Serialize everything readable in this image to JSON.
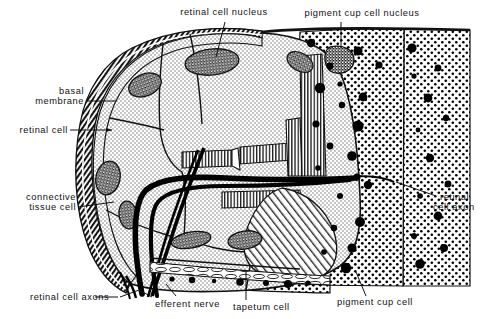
{
  "figure": {
    "colors": {
      "ink": "#111111",
      "background": "#ffffff",
      "cytoplasm_stipple": "#9a9a9a",
      "nucleus_speckle": "#3b3b3b",
      "pigment_granule": "#000000",
      "nerve_fiber": "#000000"
    }
  },
  "labels": {
    "retinal_cell_nucleus": "retinal cell nucleus",
    "pigment_cup_cell_nucleus": "pigment cup cell nucleus",
    "basal_membrane_line1": "basal",
    "basal_membrane_line2": "membrane",
    "retinal_cell": "retinal cell",
    "connective_tissue_cell_line1": "connective",
    "connective_tissue_cell_line2": "tissue cell",
    "retinal_cell_axons": "retinal cell axons",
    "efferent_nerve": "efferent nerve",
    "tapetum_cell": "tapetum cell",
    "pigment_cup_cell": "pigment cup cell",
    "retinal_cell_axon_line1": "retinal",
    "retinal_cell_axon_line2": "cell axon"
  },
  "structures": [
    {
      "name": "retinal-cell",
      "count": 6,
      "fill": "stipple",
      "description": "large stippled cells filling upper left two-thirds"
    },
    {
      "name": "retinal-cell-nucleus",
      "count": 7,
      "fill": "speckle",
      "description": "dark speckled oval nuclei inside retinal cells"
    },
    {
      "name": "basal-membrane",
      "count": 1,
      "fill": "hatch",
      "description": "dark hatched band along outer left margin"
    },
    {
      "name": "connective-tissue-cell",
      "count": 1,
      "fill": "stipple",
      "description": "narrow cell layer under basal membrane on left"
    },
    {
      "name": "rhabdomere-microvilli",
      "count": 4,
      "fill": "comb-hatch",
      "description": "comb-like microvilli borders between retinal cells"
    },
    {
      "name": "efferent-nerve",
      "count": 1,
      "fill": "solid-black",
      "description": "thick black fibre running from centre to lower left"
    },
    {
      "name": "retinal-cell-axon-bundle",
      "count": 1,
      "fill": "solid-black",
      "description": "black axon strands exiting at lower left"
    },
    {
      "name": "tapetum-cell",
      "count": 1,
      "fill": "elongated-cells",
      "description": "layer of flattened cells along lower boundary"
    },
    {
      "name": "pigment-cup-cell",
      "count": 3,
      "fill": "dot-grid",
      "description": "dot-grid region on right with black pigment granules"
    },
    {
      "name": "pigment-granule",
      "count": 34,
      "fill": "solid-black",
      "description": "black circles scattered through pigment cup"
    },
    {
      "name": "pigment-cup-cell-nucleus",
      "count": 1,
      "fill": "speckle",
      "description": "speckled triangular nucleus in upper pigment cup"
    }
  ]
}
